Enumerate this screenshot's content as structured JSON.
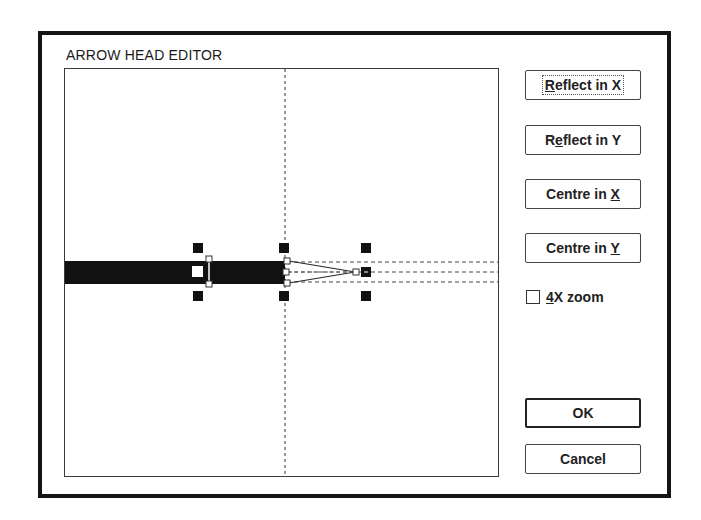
{
  "dialog": {
    "title": "ARROW HEAD EDITOR"
  },
  "buttons": {
    "reflect_x": {
      "pre": "",
      "ul": "R",
      "post": "eflect in X"
    },
    "reflect_y": {
      "pre": "R",
      "ul": "e",
      "post": "flect in Y"
    },
    "centre_x": {
      "pre": "Centre in ",
      "ul": "X",
      "post": ""
    },
    "centre_y": {
      "pre": "Centre in ",
      "ul": "Y",
      "post": ""
    },
    "ok": "OK",
    "cancel": "Cancel"
  },
  "zoom_checkbox": {
    "pre": "",
    "ul": "4",
    "post": "X zoom",
    "checked": false
  },
  "colors": {
    "frame": "#151515",
    "shaft": "#111111",
    "background": "#ffffff"
  }
}
